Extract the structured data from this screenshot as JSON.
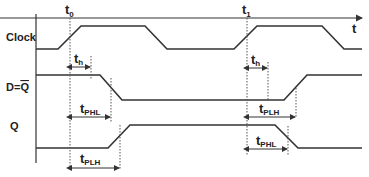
{
  "diagram": {
    "time_axis_label": "t",
    "time_markers": [
      {
        "name": "t",
        "sub": "0"
      },
      {
        "name": "t",
        "sub": "1"
      }
    ],
    "signals": [
      {
        "label": "Clock"
      },
      {
        "label": "D = Q̄",
        "main": "D=",
        "overbar": "Q"
      },
      {
        "label": "Q"
      }
    ],
    "intervals": [
      {
        "name": "t",
        "sub": "h",
        "signal": "D",
        "edge": "t0"
      },
      {
        "name": "t",
        "sub": "PHL",
        "signal": "D",
        "edge": "t0"
      },
      {
        "name": "t",
        "sub": "PLH",
        "signal": "Q",
        "edge": "t0"
      },
      {
        "name": "t",
        "sub": "h",
        "signal": "D",
        "edge": "t1"
      },
      {
        "name": "t",
        "sub": "PLH",
        "signal": "D",
        "edge": "t1"
      },
      {
        "name": "t",
        "sub": "PHL",
        "signal": "Q",
        "edge": "t1"
      }
    ]
  }
}
